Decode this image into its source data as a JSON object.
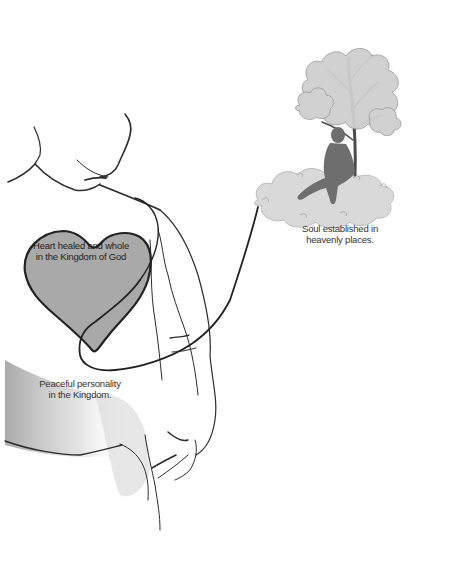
{
  "diagram": {
    "title": "",
    "style": "grayscale line illustration",
    "colors": {
      "background": "#ffffff",
      "line": "#2b2b2b",
      "heart_fill": "#a9a9a9",
      "cloud_fill": "#d9d9d9",
      "tree_foliage": "#cfcfcf",
      "silhouette": "#6e6e6e",
      "body_shadow": "#bdbdbd"
    },
    "figures": [
      {
        "id": "person-outline",
        "description": "Line drawing of a person's chin, neck and torso with arm"
      },
      {
        "id": "heart",
        "description": "Gray heart on the chest"
      },
      {
        "id": "cloud-scene",
        "description": "Silhouette of a man sitting under a tree on a cloud"
      },
      {
        "id": "connector-line",
        "description": "Thin line from cloud looping around the heart"
      }
    ],
    "labels": {
      "heart": {
        "line1": "Heart healed and whole",
        "line2": "in the Kingdom of God"
      },
      "soul": {
        "line1": "Soul established in",
        "line2": "heavenly places."
      },
      "personality": {
        "line1": "Peaceful personality",
        "line2": "in the Kingdom."
      }
    }
  }
}
